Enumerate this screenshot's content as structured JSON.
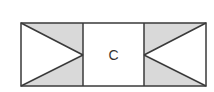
{
  "diagram": {
    "center_label": "C",
    "colors": {
      "stroke": "#3a3a3a",
      "shade": "#d9d9d9",
      "background": "#ffffff"
    },
    "cells": [
      {
        "name": "left-cell",
        "shape": "triangle-pointing-right",
        "shaded": "top-and-bottom-wedges"
      },
      {
        "name": "center-cell",
        "label": "C"
      },
      {
        "name": "right-cell",
        "shape": "triangle-pointing-left",
        "shaded": "top-and-bottom-wedges"
      }
    ]
  }
}
